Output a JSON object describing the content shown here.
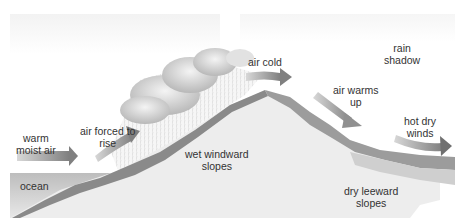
{
  "labels": {
    "warm_moist_air": [
      "warm",
      "moist air"
    ],
    "air_forced_to_rise": [
      "air forced to",
      "rise"
    ],
    "air_cold": "air cold",
    "rain_shadow": [
      "rain",
      "shadow"
    ],
    "air_warms_up": [
      "air warms",
      "up"
    ],
    "hot_dry_winds": [
      "hot dry",
      "winds"
    ],
    "wet_windward_slopes": [
      "wet windward",
      "slopes"
    ],
    "dry_leeward_slopes": [
      "dry leeward",
      "slopes"
    ],
    "ocean": "ocean"
  },
  "colors": {
    "sky_band": "#f2f2f2",
    "ocean": "#c9c9c9",
    "ground": "#ececec",
    "slope_dark": "#7a7a7a",
    "slope_mid": "#9a9a9a",
    "arrow": "#8c8c8c",
    "cloud": "#d6d6d6",
    "text": "#333333"
  }
}
